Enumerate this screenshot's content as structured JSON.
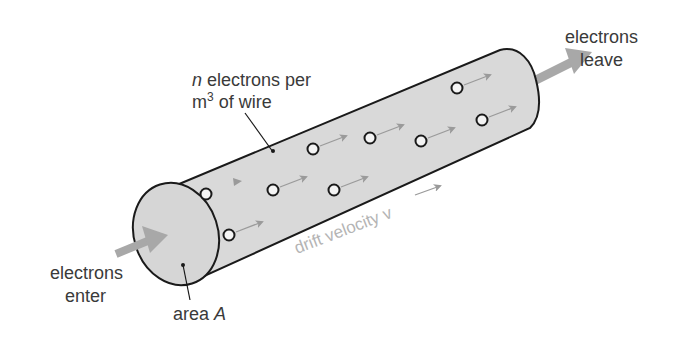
{
  "diagram": {
    "labels": {
      "density_line1_var": "n",
      "density_line1_rest": " electrons per",
      "density_line2_unit": "m",
      "density_line2_exp": "3",
      "density_line2_rest": " of wire",
      "leave_line1": "electrons",
      "leave_line2": "leave",
      "enter_line1": "electrons",
      "enter_line2": "enter",
      "area_text": "area ",
      "area_var": "A",
      "drift_text": "drift velocity v"
    },
    "colors": {
      "wire_fill": "#d9d9d9",
      "wire_outline": "#1a1a1a",
      "arrow_gray": "#a8a8a8",
      "drift_arrow": "#9a9a9a",
      "text": "#3a3a3a",
      "drift_text": "#b4b4b4"
    },
    "electrons": [
      {
        "x": 206,
        "y": 194,
        "arrow": false
      },
      {
        "x": 229,
        "y": 235,
        "arrow": true
      },
      {
        "x": 273,
        "y": 190,
        "arrow": true
      },
      {
        "x": 334,
        "y": 190,
        "arrow": true
      },
      {
        "x": 313,
        "y": 149,
        "arrow": true
      },
      {
        "x": 370,
        "y": 138,
        "arrow": true
      },
      {
        "x": 421,
        "y": 141,
        "arrow": true
      },
      {
        "x": 457,
        "y": 88,
        "arrow": true
      },
      {
        "x": 482,
        "y": 120,
        "arrow": true
      }
    ]
  }
}
